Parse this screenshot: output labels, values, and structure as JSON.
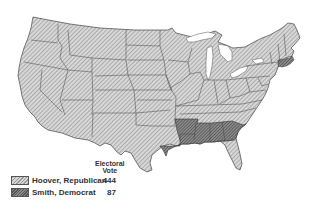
{
  "legend": {
    "header_line1": "Electoral",
    "header_line2": "Vote",
    "entries": [
      {
        "label": "Hoover, Republican",
        "votes": "444",
        "color": "#bdbdbd"
      },
      {
        "label": "Smith, Democrat",
        "votes": "87",
        "color": "#6e6e6e"
      }
    ]
  },
  "map": {
    "description": "1928 US presidential election electoral map",
    "smith_states": [
      "Arkansas",
      "Louisiana",
      "Mississippi",
      "Alabama",
      "Georgia",
      "South Carolina",
      "Massachusetts",
      "Rhode Island"
    ]
  }
}
